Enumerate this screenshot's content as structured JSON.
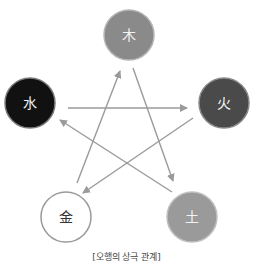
{
  "diagram": {
    "nodes": [
      {
        "id": "wood",
        "label": "木",
        "cx": 129,
        "cy": 35,
        "r": 25,
        "fill": "#8a8a8a",
        "stroke": "#b5b5b5",
        "text_color": "#f2f2f2"
      },
      {
        "id": "fire",
        "label": "火",
        "cx": 224,
        "cy": 103,
        "r": 25,
        "fill": "#4a4a4a",
        "stroke": "#8a8a8a",
        "text_color": "#f2f2f2"
      },
      {
        "id": "earth",
        "label": "土",
        "cx": 192,
        "cy": 217,
        "r": 25,
        "fill": "#9a9a9a",
        "stroke": "#c0c0c0",
        "text_color": "#f2f2f2"
      },
      {
        "id": "metal",
        "label": "金",
        "cx": 66,
        "cy": 217,
        "r": 25,
        "fill": "#ffffff",
        "stroke": "#9a9a9a",
        "text_color": "#333333"
      },
      {
        "id": "water",
        "label": "水",
        "cx": 30,
        "cy": 103,
        "r": 25,
        "fill": "#111111",
        "stroke": "#7a7a7a",
        "text_color": "#f2f2f2"
      }
    ],
    "edges": [
      {
        "from": "wood",
        "to": "earth",
        "x1": 133,
        "y1": 68,
        "x2": 173,
        "y2": 181
      },
      {
        "from": "earth",
        "to": "water",
        "x1": 172,
        "y1": 192,
        "x2": 60,
        "y2": 120
      },
      {
        "from": "water",
        "to": "fire",
        "x1": 68,
        "y1": 108,
        "x2": 187,
        "y2": 108
      },
      {
        "from": "fire",
        "to": "metal",
        "x1": 193,
        "y1": 118,
        "x2": 83,
        "y2": 193
      },
      {
        "from": "metal",
        "to": "wood",
        "x1": 77,
        "y1": 183,
        "x2": 120,
        "y2": 71
      }
    ],
    "edge_color": "#9a9a9a",
    "caption": "[오행의 상극 관계]"
  }
}
